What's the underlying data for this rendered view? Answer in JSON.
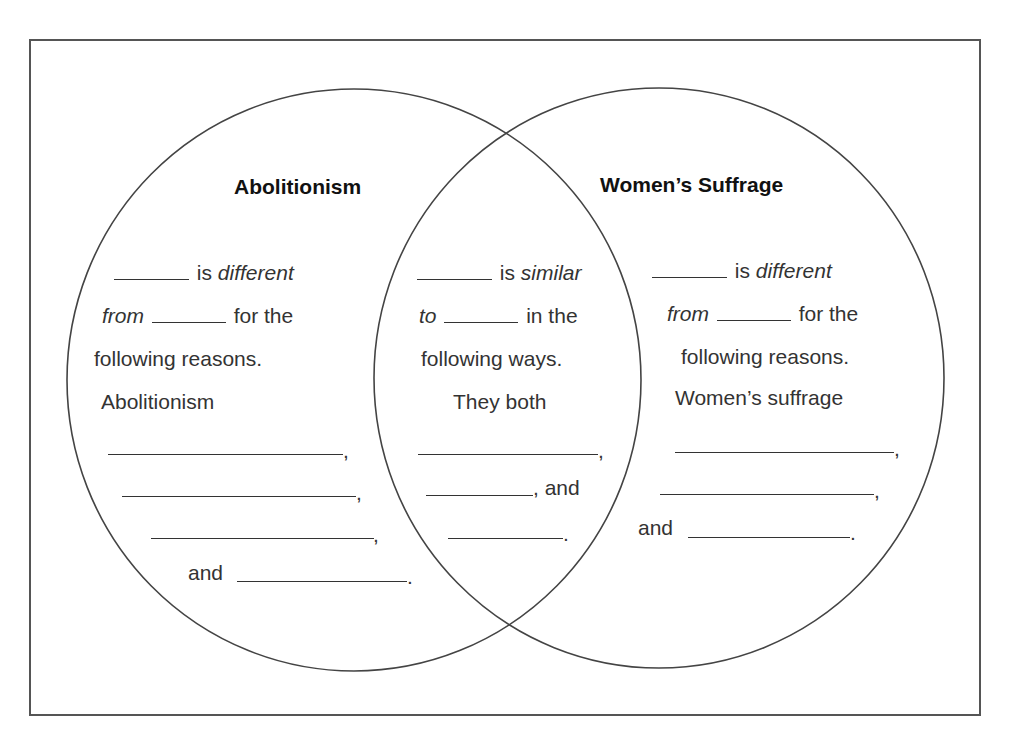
{
  "diagram": {
    "type": "venn",
    "left_circle": {
      "title": "Abolitionism",
      "lines": [
        {
          "pre_blank": true,
          "text_a": " is ",
          "italic": "different",
          "text_b": ""
        },
        {
          "italic_lead": "from",
          "blank": true,
          "text_b": " for the"
        },
        {
          "text": "following reasons."
        },
        {
          "text": "Abolitionism"
        }
      ],
      "fill_lines": [
        ",",
        ",",
        ","
      ],
      "final_line": {
        "lead": "and",
        "end": "."
      }
    },
    "overlap": {
      "lines": [
        {
          "pre_blank": true,
          "text_a": " is ",
          "italic": "similar"
        },
        {
          "italic_lead": "to",
          "blank": true,
          "text_b": " in the"
        },
        {
          "text": "following ways."
        },
        {
          "text": "They both"
        }
      ],
      "fill_lines": [
        ","
      ],
      "and_line": {
        "end": ", and"
      },
      "final_line": {
        "end": "."
      }
    },
    "right_circle": {
      "title": "Women’s Suffrage",
      "lines": [
        {
          "pre_blank": true,
          "text_a": " is ",
          "italic": "different"
        },
        {
          "italic_lead": "from",
          "blank": true,
          "text_b": " for the"
        },
        {
          "text": "following reasons."
        },
        {
          "text": "Women’s suffrage"
        }
      ],
      "fill_lines": [
        ",",
        ","
      ],
      "final_line": {
        "lead": "and",
        "end": "."
      }
    },
    "colors": {
      "outline": "#444444",
      "text": "#333333",
      "heading": "#111111",
      "background": "#ffffff"
    }
  }
}
